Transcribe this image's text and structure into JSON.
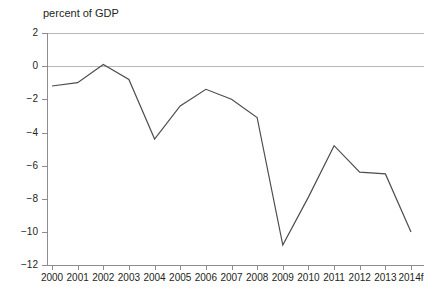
{
  "chart_data": {
    "type": "line",
    "title": "percent of GDP",
    "subtitle": "",
    "xlabel": "",
    "ylabel": "",
    "categories": [
      "2000",
      "2001",
      "2002",
      "2003",
      "2004",
      "2005",
      "2006",
      "2007",
      "2008",
      "2009",
      "2010",
      "2011",
      "2012",
      "2013",
      "2014f"
    ],
    "values": [
      -1.2,
      -1.0,
      0.1,
      -0.8,
      -4.4,
      -2.4,
      -1.4,
      -2.0,
      -3.1,
      -10.8,
      -7.9,
      -4.8,
      -6.4,
      -6.5,
      -10.0
    ],
    "series": [
      {
        "name": "balance",
        "values": [
          -1.2,
          -1.0,
          0.1,
          -0.8,
          -4.4,
          -2.4,
          -1.4,
          -2.0,
          -3.1,
          -10.8,
          -7.9,
          -4.8,
          -6.4,
          -6.5,
          -10.0
        ]
      }
    ],
    "ylim": [
      -12,
      2
    ],
    "yticks": [
      2,
      0,
      -2,
      -4,
      -6,
      -8,
      -10,
      -12
    ],
    "ytick_labels": [
      "2",
      "0",
      "−2",
      "−4",
      "−6",
      "−8",
      "−10",
      "−12"
    ],
    "xtick_labels": [
      "2000",
      "2001",
      "2002",
      "2003",
      "2004",
      "2005",
      "2006",
      "2007",
      "2008",
      "2009",
      "2010",
      "2011",
      "2012",
      "2013",
      "2014f"
    ],
    "grid": "horizontal-at-2-and-0",
    "gridlines": [
      2,
      0
    ],
    "legend": "none",
    "legend_position": "none",
    "annotations": [],
    "line_color": "#4d4d4d",
    "grid_color": "#b8b8b8",
    "axis_color": "#8d8d8d",
    "background_color": "#ffffff",
    "text_color": "#231f20"
  }
}
